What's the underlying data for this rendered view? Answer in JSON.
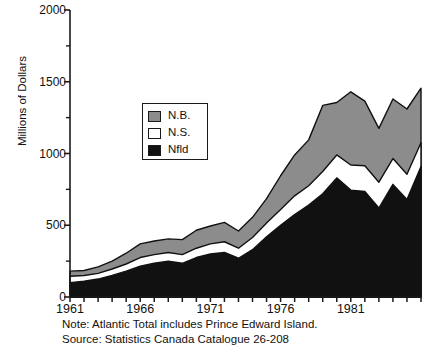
{
  "chart_data": {
    "type": "area",
    "stacked": true,
    "title": "",
    "subtitle": "",
    "xlabel": "",
    "ylabel": "Millions of Dollars",
    "xlim": [
      1961,
      1986
    ],
    "ylim": [
      0,
      2000
    ],
    "grid": false,
    "x": [
      1961,
      1962,
      1963,
      1964,
      1965,
      1966,
      1967,
      1968,
      1969,
      1970,
      1971,
      1972,
      1973,
      1974,
      1975,
      1976,
      1977,
      1978,
      1979,
      1980,
      1981,
      1982,
      1983,
      1984,
      1985,
      1986
    ],
    "xtick_labels": [
      "1961",
      "1966",
      "1971",
      "1976",
      "1981"
    ],
    "xtick_values": [
      1961,
      1966,
      1971,
      1976,
      1981
    ],
    "ytick_labels": [
      "0",
      "500",
      "1000",
      "1500",
      "2000"
    ],
    "ytick_values": [
      0,
      500,
      1000,
      1500,
      2000
    ],
    "series": [
      {
        "name": "Nfld",
        "color": "#111111",
        "order": 0,
        "values": [
          100,
          110,
          125,
          150,
          180,
          215,
          235,
          250,
          235,
          275,
          300,
          310,
          270,
          330,
          420,
          500,
          575,
          640,
          720,
          830,
          745,
          735,
          620,
          785,
          680,
          910
        ]
      },
      {
        "name": "N.S.",
        "color": "#ffffff",
        "order": 1,
        "values": [
          45,
          40,
          40,
          45,
          50,
          60,
          60,
          60,
          60,
          65,
          70,
          75,
          70,
          85,
          95,
          110,
          130,
          135,
          155,
          160,
          175,
          180,
          180,
          180,
          175,
          165
        ]
      },
      {
        "name": "N.B.",
        "color": "#8c8c8c",
        "order": 2,
        "values": [
          35,
          35,
          45,
          55,
          75,
          95,
          95,
          95,
          105,
          125,
          125,
          135,
          120,
          140,
          170,
          235,
          285,
          320,
          460,
          365,
          510,
          450,
          375,
          415,
          455,
          380
        ]
      }
    ],
    "totals": [
      180,
      185,
      210,
      250,
      305,
      370,
      390,
      405,
      400,
      465,
      495,
      520,
      460,
      555,
      685,
      845,
      990,
      1095,
      1335,
      1355,
      1430,
      1365,
      1175,
      1380,
      1310,
      1455
    ],
    "legend": {
      "position": "inside-left",
      "entries": [
        {
          "label": "N.B.",
          "color": "#8c8c8c"
        },
        {
          "label": "N.S.",
          "color": "#ffffff"
        },
        {
          "label": "Nfld",
          "color": "#111111"
        }
      ]
    },
    "annotations": [
      "Note: Atlantic Total includes Prince Edward Island.",
      "Source: Statistics Canada Catalogue 26-208"
    ]
  },
  "axes": {
    "y_axis_title": "Millions of Dollars"
  },
  "footnotes": {
    "note": "Note: Atlantic Total includes Prince Edward Island.",
    "source": "Source: Statistics Canada Catalogue 26-208"
  },
  "colors": {
    "nb": "#8c8c8c",
    "ns": "#ffffff",
    "nfld": "#111111",
    "axis": "#1a1a1a",
    "background": "#ffffff"
  }
}
